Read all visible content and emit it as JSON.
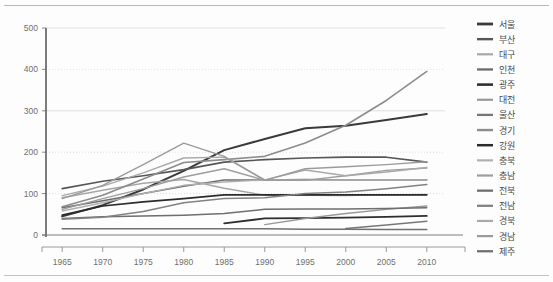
{
  "chart_data": {
    "type": "line",
    "title": "",
    "xlabel": "",
    "ylabel": "",
    "x": [
      1965,
      1970,
      1975,
      1980,
      1985,
      1990,
      1995,
      2000,
      2005,
      2010
    ],
    "xlim": [
      1963,
      2012
    ],
    "ylim": [
      0,
      500
    ],
    "yticks": [
      0,
      100,
      200,
      300,
      400,
      500
    ],
    "xticks": [
      "1965",
      "1970",
      "1975",
      "1980",
      "1985",
      "1990",
      "1995",
      "2000",
      "2005",
      "2010"
    ],
    "grid": true,
    "legend_position": "right",
    "series": [
      {
        "name": "서울",
        "color": "#3a3a3a",
        "width": 2.0,
        "x": [
          1965,
          1970,
          1975,
          1980,
          1985,
          1990,
          1995,
          2000,
          2005,
          2010
        ],
        "values": [
          45,
          72,
          110,
          155,
          205,
          232,
          258,
          264,
          278,
          292
        ]
      },
      {
        "name": "부산",
        "color": "#565656",
        "width": 1.6,
        "x": [
          1965,
          1970,
          1975,
          1980,
          1985,
          1990,
          1995,
          2000,
          2005,
          2010
        ],
        "values": [
          112,
          130,
          143,
          158,
          176,
          182,
          186,
          188,
          188,
          176
        ]
      },
      {
        "name": "대구",
        "color": "#a6a6a6",
        "width": 1.4,
        "x": [
          1965,
          1970,
          1975,
          1980,
          1985,
          1990,
          1995,
          2000,
          2005,
          2010
        ],
        "values": [
          90,
          108,
          125,
          134,
          113,
          96,
          96,
          95,
          97,
          98
        ]
      },
      {
        "name": "인천",
        "color": "#6b6b6b",
        "width": 1.5,
        "x": [
          1965,
          1970,
          1975,
          1980,
          1985,
          1990,
          1995,
          2000,
          2005,
          2010
        ],
        "values": [
          66,
          83,
          100,
          118,
          133,
          133,
          134,
          133,
          133,
          133
        ]
      },
      {
        "name": "광주",
        "color": "#2e2e2e",
        "width": 1.8,
        "x": [
          1985,
          1990,
          1995,
          2000,
          2005,
          2010
        ],
        "values": [
          28,
          40,
          41,
          42,
          44,
          46
        ]
      },
      {
        "name": "대전",
        "color": "#989898",
        "width": 1.4,
        "x": [
          1990,
          1995,
          2000,
          2005,
          2010
        ],
        "values": [
          25,
          40,
          52,
          62,
          70
        ]
      },
      {
        "name": "울산",
        "color": "#777777",
        "width": 1.5,
        "x": [
          2000,
          2005,
          2010
        ],
        "values": [
          16,
          24,
          33
        ]
      },
      {
        "name": "경기",
        "color": "#8c8c8c",
        "width": 1.6,
        "x": [
          1965,
          1970,
          1975,
          1980,
          1985,
          1990,
          1995,
          2000,
          2005,
          2010
        ],
        "values": [
          68,
          96,
          135,
          175,
          182,
          190,
          222,
          265,
          325,
          395
        ]
      },
      {
        "name": "강원",
        "color": "#2b2b2b",
        "width": 1.7,
        "x": [
          1965,
          1970,
          1975,
          1980,
          1985,
          1990,
          1995,
          2000,
          2005,
          2010
        ],
        "values": [
          48,
          70,
          80,
          88,
          97,
          97,
          97,
          97,
          97,
          97
        ]
      },
      {
        "name": "충북",
        "color": "#b0b0b0",
        "width": 1.4,
        "x": [
          1965,
          1970,
          1975,
          1980,
          1985,
          1990,
          1995,
          2000,
          2005,
          2010
        ],
        "values": [
          58,
          78,
          100,
          120,
          128,
          133,
          133,
          133,
          133,
          133
        ]
      },
      {
        "name": "충남",
        "color": "#9d9d9d",
        "width": 1.4,
        "x": [
          1965,
          1970,
          1975,
          1980,
          1985,
          1990,
          1995,
          2000,
          2005,
          2010
        ],
        "values": [
          62,
          88,
          112,
          140,
          160,
          132,
          132,
          143,
          156,
          162
        ]
      },
      {
        "name": "전북",
        "color": "#6e6e6e",
        "width": 1.5,
        "x": [
          1965,
          1970,
          1975,
          1980,
          1985,
          1990,
          1995,
          2000,
          2005,
          2010
        ],
        "values": [
          40,
          44,
          46,
          48,
          52,
          62,
          63,
          63,
          64,
          66
        ]
      },
      {
        "name": "전남",
        "color": "#828282",
        "width": 1.5,
        "x": [
          1965,
          1970,
          1975,
          1980,
          1985,
          1990,
          1995,
          2000,
          2005,
          2010
        ],
        "values": [
          38,
          43,
          57,
          78,
          88,
          90,
          100,
          104,
          112,
          122
        ]
      },
      {
        "name": "경북",
        "color": "#a9a9a9",
        "width": 1.4,
        "x": [
          1965,
          1970,
          1975,
          1980,
          1985,
          1990,
          1995,
          2000,
          2005,
          2010
        ],
        "values": [
          95,
          118,
          150,
          186,
          188,
          133,
          157,
          143,
          152,
          163
        ]
      },
      {
        "name": "경남",
        "color": "#9b9b9b",
        "width": 1.4,
        "x": [
          1965,
          1970,
          1975,
          1980,
          1985,
          1990,
          1995,
          2000,
          2005,
          2010
        ],
        "values": [
          88,
          120,
          170,
          222,
          190,
          132,
          160,
          165,
          170,
          177
        ]
      },
      {
        "name": "제주",
        "color": "#707070",
        "width": 1.5,
        "x": [
          1965,
          1970,
          1975,
          1980,
          1985,
          1990,
          1995,
          2000,
          2005,
          2010
        ],
        "values": [
          15,
          15,
          15,
          15,
          15,
          15,
          14,
          14,
          13,
          13
        ]
      }
    ]
  }
}
